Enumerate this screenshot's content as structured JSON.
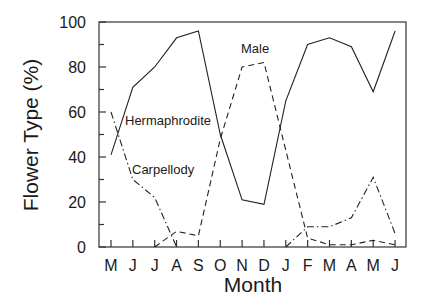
{
  "chart_data": {
    "type": "line",
    "title": "",
    "xlabel": "Month",
    "ylabel": "Flower Type (%)",
    "ylim": [
      0,
      100
    ],
    "yticks": [
      "0",
      "20",
      "40",
      "60",
      "80",
      "100"
    ],
    "grid": false,
    "legend": "inline labels",
    "categories": [
      "M",
      "J",
      "J",
      "A",
      "S",
      "O",
      "N",
      "D",
      "J",
      "F",
      "M",
      "A",
      "M",
      "J"
    ],
    "series": [
      {
        "name": "Hermaphrodite",
        "style": "solid",
        "values": [
          41,
          71,
          80,
          93,
          96,
          50,
          21,
          19,
          65,
          90,
          93,
          89,
          69,
          96
        ]
      },
      {
        "name": "Male",
        "style": "dashed",
        "values": [
          null,
          null,
          0,
          7,
          5,
          48,
          80,
          82,
          43,
          4,
          1,
          1,
          3,
          1
        ]
      },
      {
        "name": "Carpellody",
        "style": "dash-dot",
        "values": [
          60,
          30,
          22,
          0,
          null,
          null,
          null,
          null,
          0,
          9,
          9,
          13,
          31,
          6
        ]
      }
    ],
    "annotations": [
      {
        "text": "Hermaphrodite",
        "x_index": 1.2,
        "y": 56
      },
      {
        "text": "Male",
        "x_index": 6.6,
        "y": 88
      },
      {
        "text": "Carpellody",
        "x_index": 1.2,
        "y": 35
      }
    ]
  }
}
